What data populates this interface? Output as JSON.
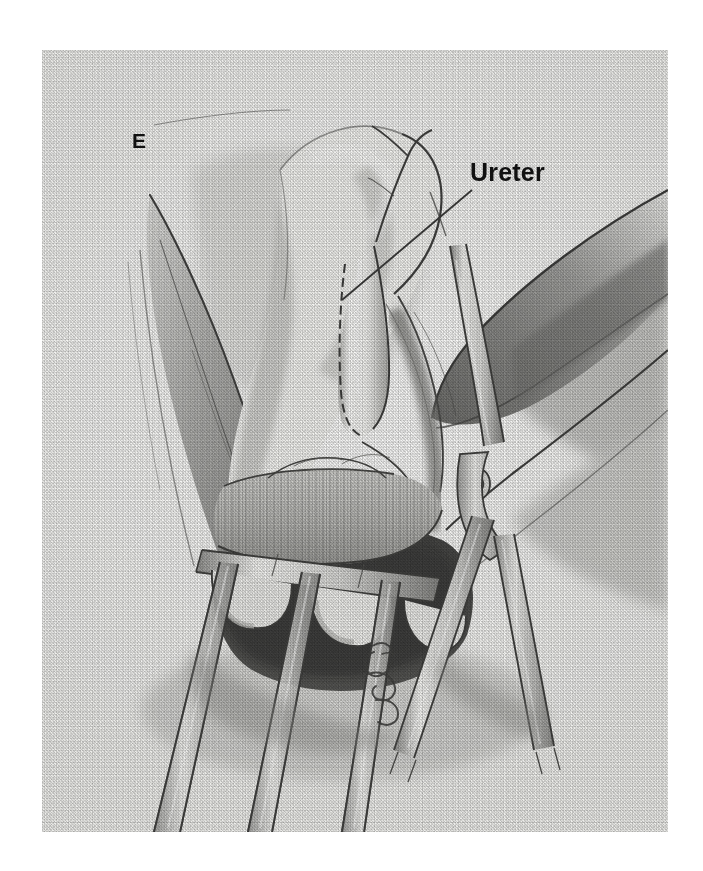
{
  "figure": {
    "kind": "surgical-illustration",
    "medium": "graphite-stipple-drawing",
    "palette": {
      "ink": "#1a1a1a",
      "paper": "#f7f7f6",
      "shadow": "#4a4a4a",
      "deep_shadow": "#232323",
      "margin": "#ffffff"
    },
    "panel_letter": "E",
    "labels": [
      {
        "id": "panel-letter",
        "text": "E",
        "x": 90,
        "y": 80
      },
      {
        "id": "ureter",
        "text": "Ureter",
        "x": 428,
        "y": 110,
        "leader_line": true
      }
    ],
    "leader_lines": [
      {
        "id": "ureter-leader",
        "from_x": 430,
        "from_y": 140,
        "to_x": 300,
        "to_y": 250
      },
      {
        "id": "panel-e-leader",
        "from_x": 112,
        "from_y": 75,
        "to_x": 240,
        "to_y": 62
      }
    ],
    "anatomy": [
      {
        "id": "ureter-tube",
        "label": "Ureter"
      },
      {
        "id": "retracted-tissue-flap-left",
        "label": ""
      },
      {
        "id": "retracted-tissue-flap-right",
        "label": ""
      },
      {
        "id": "vaginal-cuff-tissue",
        "label": ""
      },
      {
        "id": "deep-cavity-shadow",
        "label": ""
      },
      {
        "id": "striated-muscle-fibers",
        "label": ""
      }
    ],
    "instruments": [
      {
        "id": "three-prong-retractor",
        "prongs": 3
      },
      {
        "id": "surgical-clamp",
        "has_pivot_screw": true
      }
    ],
    "signature": {
      "id": "artist-monogram",
      "visible": true
    }
  }
}
